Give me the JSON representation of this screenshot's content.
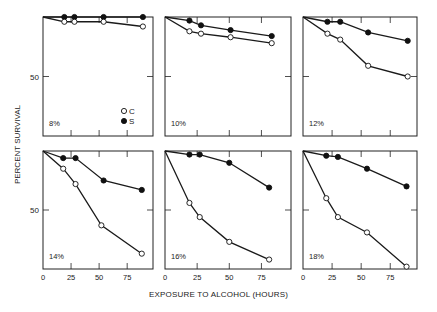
{
  "chart_data": {
    "type": "line",
    "title": "",
    "xlabel": "EXPOSURE TO ALCOHOL (HOURS)",
    "ylabel": "PERCENT SURVIVAL",
    "xlim": [
      0,
      98
    ],
    "ylim": [
      0,
      100
    ],
    "x_ticks": [
      0,
      25,
      50,
      75
    ],
    "y_ticks": [
      50
    ],
    "grid": false,
    "legend": {
      "position": "inside first panel, lower right",
      "entries": [
        {
          "label": "C",
          "marker": "open-circle"
        },
        {
          "label": "S",
          "marker": "filled-circle"
        }
      ]
    },
    "panels": [
      {
        "label": "8%",
        "series": [
          {
            "name": "C",
            "x": [
              0,
              19,
              28,
              54,
              89
            ],
            "y": [
              100,
              96,
              96,
              96,
              92
            ]
          },
          {
            "name": "S",
            "x": [
              0,
              19,
              28,
              54,
              89
            ],
            "y": [
              100,
              100,
              100,
              100,
              100
            ]
          }
        ]
      },
      {
        "label": "10%",
        "series": [
          {
            "name": "C",
            "x": [
              0,
              19,
              28,
              51,
              83
            ],
            "y": [
              100,
              88,
              86,
              83,
              78
            ]
          },
          {
            "name": "S",
            "x": [
              0,
              19,
              28,
              51,
              83
            ],
            "y": [
              100,
              97,
              93,
              89,
              84
            ]
          }
        ]
      },
      {
        "label": "12%",
        "series": [
          {
            "name": "C",
            "x": [
              0,
              21,
              32,
              56,
              90
            ],
            "y": [
              100,
              86,
              81,
              59,
              50
            ]
          },
          {
            "name": "S",
            "x": [
              0,
              21,
              32,
              56,
              90
            ],
            "y": [
              100,
              96,
              96,
              87,
              80
            ]
          }
        ]
      },
      {
        "label": "14%",
        "series": [
          {
            "name": "C",
            "x": [
              0,
              18,
              29,
              52,
              88
            ],
            "y": [
              100,
              85,
              72,
              37,
              13
            ]
          },
          {
            "name": "S",
            "x": [
              0,
              18,
              29,
              54,
              88
            ],
            "y": [
              100,
              94,
              94,
              75,
              67
            ]
          }
        ]
      },
      {
        "label": "16%",
        "series": [
          {
            "name": "C",
            "x": [
              0,
              19,
              27,
              50,
              81
            ],
            "y": [
              100,
              56,
              44,
              23,
              8
            ]
          },
          {
            "name": "S",
            "x": [
              0,
              19,
              27,
              50,
              81
            ],
            "y": [
              100,
              97,
              97,
              90,
              69
            ]
          }
        ]
      },
      {
        "label": "18%",
        "series": [
          {
            "name": "C",
            "x": [
              0,
              20,
              30,
              55,
              89
            ],
            "y": [
              100,
              60,
              44,
              31,
              2
            ]
          },
          {
            "name": "S",
            "x": [
              0,
              20,
              30,
              55,
              89
            ],
            "y": [
              100,
              96,
              95,
              85,
              70
            ]
          }
        ]
      }
    ]
  },
  "labels": {
    "x_axis_title": "EXPOSURE TO ALCOHOL (HOURS)",
    "y_axis_title": "PERCENT SURVIVAL"
  }
}
